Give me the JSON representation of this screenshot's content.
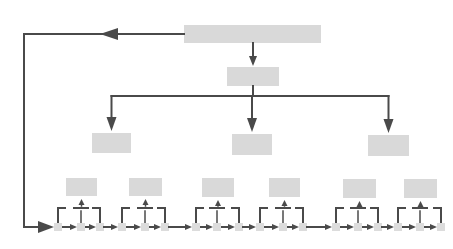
{
  "diagram": {
    "type": "hierarchy-flow",
    "width": 453,
    "height": 249,
    "colors": {
      "box_fill": "#d9d9d9",
      "node_fill": "#dcdcdc",
      "line": "#4a4a4a",
      "background": "#ffffff"
    },
    "root": {
      "id": "root",
      "x": 184,
      "y": 25,
      "w": 137,
      "h": 18,
      "label": ""
    },
    "level1": {
      "id": "level1",
      "x": 227,
      "y": 67,
      "w": 52,
      "h": 19,
      "label": ""
    },
    "level2": [
      {
        "id": "l2-left",
        "x": 92,
        "y": 133,
        "w": 39,
        "h": 20,
        "label": ""
      },
      {
        "id": "l2-mid",
        "x": 232,
        "y": 134,
        "w": 40,
        "h": 21,
        "label": ""
      },
      {
        "id": "l2-right",
        "x": 368,
        "y": 135,
        "w": 41,
        "h": 21,
        "label": ""
      }
    ],
    "groups": [
      {
        "id": "g1",
        "box": {
          "x": 66,
          "y": 178,
          "w": 31,
          "h": 18
        },
        "nodes": [
          58,
          81,
          100
        ]
      },
      {
        "id": "g2",
        "box": {
          "x": 129,
          "y": 178,
          "w": 33,
          "h": 18
        },
        "nodes": [
          122,
          145,
          165
        ]
      },
      {
        "id": "g3",
        "box": {
          "x": 202,
          "y": 178,
          "w": 32,
          "h": 19
        },
        "nodes": [
          196,
          217,
          239
        ]
      },
      {
        "id": "g4",
        "box": {
          "x": 269,
          "y": 178,
          "w": 31,
          "h": 19
        },
        "nodes": [
          260,
          283,
          303
        ]
      },
      {
        "id": "g5",
        "box": {
          "x": 343,
          "y": 179,
          "w": 33,
          "h": 19
        },
        "nodes": [
          336,
          358,
          378
        ]
      },
      {
        "id": "g6",
        "box": {
          "x": 404,
          "y": 179,
          "w": 33,
          "h": 19
        },
        "nodes": [
          398,
          420,
          441
        ]
      }
    ],
    "baseline_y": 227,
    "bracket_y": 208,
    "branch_y": 96,
    "feedback": {
      "left_x": 24,
      "top_y": 34,
      "arrow_x": 100
    }
  }
}
